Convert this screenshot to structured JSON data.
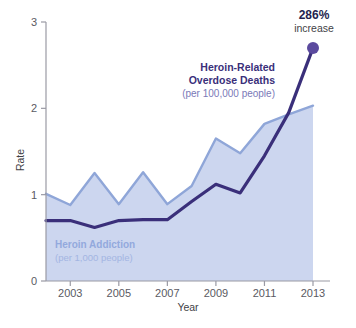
{
  "chart_data": {
    "type": "area",
    "title": "",
    "xlabel": "Year",
    "ylabel": "Rate",
    "xlim": [
      2002,
      2013
    ],
    "ylim": [
      0,
      3
    ],
    "grid": false,
    "legend_position": "inline-annotations",
    "x": [
      2002,
      2003,
      2004,
      2005,
      2006,
      2007,
      2008,
      2009,
      2010,
      2011,
      2012,
      2013
    ],
    "xticks": [
      2003,
      2005,
      2007,
      2009,
      2011,
      2013
    ],
    "xtick_labels": [
      "2003",
      "2005",
      "2007",
      "2009",
      "2011",
      "2013"
    ],
    "yticks": [
      0,
      1,
      2,
      3
    ],
    "ytick_labels": [
      "0",
      "1",
      "2",
      "3"
    ],
    "series": [
      {
        "name": "Heroin Addiction",
        "unit": "per 1,000 people",
        "kind": "area",
        "color": "#8fa6d8",
        "fill": "#ccd6ef",
        "values": [
          1.01,
          0.88,
          1.25,
          0.89,
          1.26,
          0.89,
          1.1,
          1.65,
          1.48,
          1.82,
          1.93,
          2.03
        ]
      },
      {
        "name": "Heroin-Related Overdose Deaths",
        "unit": "per 100,000 people",
        "kind": "line",
        "color": "#3a2f7a",
        "values": [
          0.7,
          0.7,
          0.62,
          0.7,
          0.71,
          0.71,
          0.92,
          1.12,
          1.02,
          1.45,
          1.95,
          2.7
        ]
      }
    ],
    "annotations": [
      {
        "id": "overdose-label",
        "line1": "Heroin-Related",
        "line2": "Overdose Deaths",
        "line3": "(per 100,000 people)"
      },
      {
        "id": "addiction-label",
        "line1": "Heroin Addiction",
        "line2": "(per 1,000 people)"
      },
      {
        "id": "increase-callout",
        "value": "286%",
        "word": "increase",
        "marker_color": "#5b4a9e",
        "at_x": 2013,
        "at_y": 2.7
      }
    ],
    "colors": {
      "dark_line": "#3a2f7a",
      "light_line": "#8fa6d8",
      "area_fill": "#ccd6ef",
      "marker": "#5b4a9e",
      "axis": "#9a9aa4",
      "tick_text": "#5a5a62"
    }
  }
}
